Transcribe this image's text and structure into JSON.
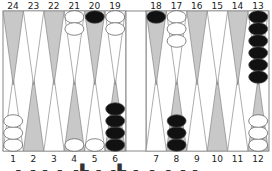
{
  "game": "backgammon",
  "colors": {
    "board_bg": "#ffffff",
    "border": "#888888",
    "dark_point": "#c8c8c8",
    "light_point": "#ffffff",
    "black_checker": "#111111",
    "white_checker": "#ffffff"
  },
  "top_labels": [
    "24",
    "23",
    "22",
    "21",
    "20",
    "19",
    "18",
    "17",
    "16",
    "15",
    "14",
    "13"
  ],
  "bottom_labels": [
    "1",
    "2",
    "3",
    "4",
    "5",
    "6",
    "7",
    "8",
    "9",
    "10",
    "11",
    "12"
  ],
  "points": {
    "1": {
      "color": "white",
      "count": 3
    },
    "2": {
      "color": null,
      "count": 0
    },
    "3": {
      "color": null,
      "count": 0
    },
    "4": {
      "color": "white",
      "count": 1
    },
    "5": {
      "color": "white",
      "count": 1
    },
    "6": {
      "color": "black",
      "count": 4
    },
    "7": {
      "color": null,
      "count": 0
    },
    "8": {
      "color": "black",
      "count": 3
    },
    "9": {
      "color": null,
      "count": 0
    },
    "10": {
      "color": null,
      "count": 0
    },
    "11": {
      "color": null,
      "count": 0
    },
    "12": {
      "color": "white",
      "count": 3
    },
    "13": {
      "color": "black",
      "count": 6
    },
    "14": {
      "color": null,
      "count": 0
    },
    "15": {
      "color": null,
      "count": 0
    },
    "16": {
      "color": null,
      "count": 0
    },
    "17": {
      "color": "white",
      "count": 3
    },
    "18": {
      "color": "black",
      "count": 1
    },
    "19": {
      "color": "white",
      "count": 2
    },
    "20": {
      "color": "black",
      "count": 1
    },
    "21": {
      "color": "white",
      "count": 2
    },
    "22": {
      "color": null,
      "count": 0
    },
    "23": {
      "color": null,
      "count": 0
    },
    "24": {
      "color": null,
      "count": 0
    }
  },
  "footer_text": "▂ ▖▗ ▖▗ ▗▙ ▖▗▙ ▖ ▖ ▖▗ ▖"
}
